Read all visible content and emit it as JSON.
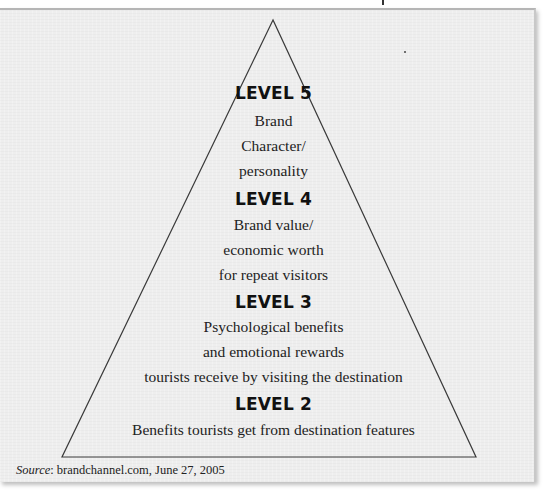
{
  "diagram": {
    "type": "pyramid",
    "levels": [
      {
        "heading": "LEVEL 5",
        "lines": [
          "Brand",
          "Character/",
          "personality"
        ]
      },
      {
        "heading": "LEVEL 4",
        "lines": [
          "Brand value/",
          "economic worth",
          "for repeat visitors"
        ]
      },
      {
        "heading": "LEVEL 3",
        "lines": [
          "Psychological benefits",
          "and emotional rewards",
          "tourists receive by visiting the destination"
        ]
      },
      {
        "heading": "LEVEL 2",
        "lines": [
          "Benefits tourists get from destination features"
        ]
      },
      {
        "heading": "LEVEL 1",
        "lines": [
          "Tangible, verifiable, objectives, & measurable characteristics of the place"
        ]
      }
    ],
    "colors": {
      "panel": "#eeeeee",
      "line": "#3a3a3a",
      "text": "#1c1c1c"
    }
  },
  "source": {
    "label": "Source",
    "text": ": brandchannel.com, June 27, 2005"
  }
}
